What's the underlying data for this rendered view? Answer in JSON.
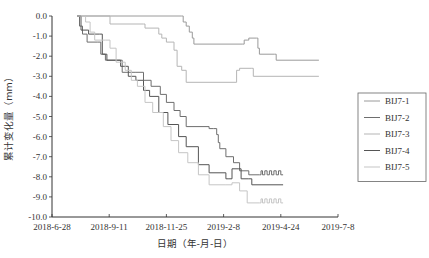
{
  "chart_data": {
    "type": "line",
    "title": "",
    "xlabel": "日期（年-月-日）",
    "ylabel": "累计变化量（mm）",
    "x_ticks": [
      "2018-6-28",
      "2018-9-11",
      "2018-11-25",
      "2019-2-8",
      "2019-4-24",
      "2019-7-8"
    ],
    "x_tick_days": [
      0,
      75,
      150,
      225,
      300,
      375
    ],
    "x_unit": "days since 2018-6-28",
    "xlim": [
      0,
      375
    ],
    "y_ticks": [
      "0.0",
      "-1.0",
      "-2.0",
      "-3.0",
      "-4.0",
      "-5.0",
      "-6.0",
      "-7.0",
      "-8.0",
      "-9.0",
      "-10.0"
    ],
    "ylim": [
      -10,
      0
    ],
    "grid": false,
    "legend_position": "right",
    "series": [
      {
        "name": "BIJ7-1",
        "color": "#9a9a9a",
        "points": [
          [
            33,
            0
          ],
          [
            170,
            0
          ],
          [
            172,
            -0.3
          ],
          [
            176,
            -0.5
          ],
          [
            180,
            -0.8
          ],
          [
            184,
            -1.1
          ],
          [
            186,
            -1.4
          ],
          [
            250,
            -1.4
          ],
          [
            252,
            -1.2
          ],
          [
            256,
            -1.2
          ],
          [
            258,
            -1.1
          ],
          [
            268,
            -1.1
          ],
          [
            270,
            -1.6
          ],
          [
            272,
            -1.9
          ],
          [
            292,
            -1.9
          ],
          [
            294,
            -2.2
          ],
          [
            350,
            -2.2
          ]
        ]
      },
      {
        "name": "BIJ7-2",
        "color": "#6e6e6e",
        "points": [
          [
            33,
            0
          ],
          [
            36,
            -0.5
          ],
          [
            40,
            -0.9
          ],
          [
            46,
            -1.3
          ],
          [
            60,
            -1.3
          ],
          [
            64,
            -1.9
          ],
          [
            70,
            -2.2
          ],
          [
            88,
            -2.2
          ],
          [
            92,
            -2.8
          ],
          [
            110,
            -2.8
          ],
          [
            120,
            -3.2
          ],
          [
            130,
            -3.5
          ],
          [
            142,
            -3.9
          ],
          [
            150,
            -4.3
          ],
          [
            160,
            -4.7
          ],
          [
            168,
            -5.0
          ],
          [
            176,
            -5.5
          ],
          [
            198,
            -5.5
          ],
          [
            206,
            -5.6
          ],
          [
            212,
            -5.6
          ],
          [
            216,
            -5.9
          ],
          [
            218,
            -6.3
          ],
          [
            220,
            -6.6
          ],
          [
            228,
            -7.0
          ],
          [
            238,
            -7.3
          ],
          [
            246,
            -7.7
          ],
          [
            258,
            -7.9
          ],
          [
            272,
            -7.9
          ],
          [
            274,
            -7.7
          ],
          [
            276,
            -7.9
          ],
          [
            279,
            -7.7
          ],
          [
            282,
            -7.9
          ],
          [
            285,
            -7.7
          ],
          [
            288,
            -7.9
          ],
          [
            291,
            -7.7
          ],
          [
            294,
            -7.9
          ],
          [
            297,
            -7.7
          ],
          [
            300,
            -7.9
          ],
          [
            303,
            -7.9
          ]
        ]
      },
      {
        "name": "BIJ7-3",
        "color": "#b5b5b5",
        "points": [
          [
            33,
            0
          ],
          [
            75,
            0
          ],
          [
            76,
            -0.4
          ],
          [
            120,
            -0.4
          ],
          [
            122,
            -0.6
          ],
          [
            140,
            -0.9
          ],
          [
            144,
            -1.1
          ],
          [
            150,
            -1.3
          ],
          [
            160,
            -1.7
          ],
          [
            164,
            -2.5
          ],
          [
            170,
            -2.7
          ],
          [
            176,
            -3.3
          ],
          [
            240,
            -3.3
          ],
          [
            242,
            -2.7
          ],
          [
            244,
            -2.7
          ],
          [
            246,
            -2.6
          ],
          [
            262,
            -2.6
          ],
          [
            264,
            -3.0
          ],
          [
            350,
            -3.0
          ]
        ]
      },
      {
        "name": "BIJ7-4",
        "color": "#555555",
        "points": [
          [
            33,
            0
          ],
          [
            38,
            -0.7
          ],
          [
            46,
            -0.7
          ],
          [
            48,
            -0.9
          ],
          [
            62,
            -0.9
          ],
          [
            66,
            -1.9
          ],
          [
            72,
            -2.2
          ],
          [
            86,
            -2.2
          ],
          [
            90,
            -2.5
          ],
          [
            100,
            -3.0
          ],
          [
            110,
            -3.2
          ],
          [
            120,
            -3.7
          ],
          [
            128,
            -4.0
          ],
          [
            140,
            -4.8
          ],
          [
            152,
            -5.4
          ],
          [
            166,
            -6.0
          ],
          [
            176,
            -6.5
          ],
          [
            192,
            -7.4
          ],
          [
            206,
            -7.8
          ],
          [
            228,
            -8.1
          ],
          [
            232,
            -8.1
          ],
          [
            236,
            -7.6
          ],
          [
            244,
            -7.6
          ],
          [
            248,
            -8.1
          ],
          [
            258,
            -8.1
          ],
          [
            262,
            -8.4
          ],
          [
            303,
            -8.4
          ]
        ]
      },
      {
        "name": "BIJ7-5",
        "color": "#c5c5c5",
        "points": [
          [
            33,
            0
          ],
          [
            44,
            -0.3
          ],
          [
            50,
            -0.8
          ],
          [
            56,
            -1.2
          ],
          [
            70,
            -1.2
          ],
          [
            76,
            -1.6
          ],
          [
            84,
            -2.3
          ],
          [
            96,
            -2.7
          ],
          [
            104,
            -3.2
          ],
          [
            112,
            -3.5
          ],
          [
            122,
            -4.3
          ],
          [
            132,
            -4.8
          ],
          [
            146,
            -5.5
          ],
          [
            156,
            -6.2
          ],
          [
            166,
            -6.8
          ],
          [
            178,
            -7.3
          ],
          [
            192,
            -7.9
          ],
          [
            206,
            -8.4
          ],
          [
            228,
            -8.4
          ],
          [
            236,
            -8.3
          ],
          [
            246,
            -8.7
          ],
          [
            256,
            -9.3
          ],
          [
            272,
            -9.3
          ],
          [
            274,
            -9.1
          ],
          [
            276,
            -9.3
          ],
          [
            279,
            -9.1
          ],
          [
            282,
            -9.3
          ],
          [
            285,
            -9.1
          ],
          [
            288,
            -9.3
          ],
          [
            291,
            -9.1
          ],
          [
            294,
            -9.3
          ],
          [
            297,
            -9.1
          ],
          [
            300,
            -9.3
          ],
          [
            303,
            -9.3
          ]
        ]
      }
    ]
  }
}
